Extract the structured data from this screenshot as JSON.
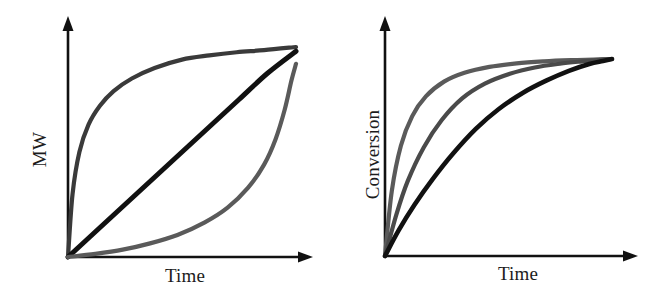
{
  "figure": {
    "background": "#ffffff",
    "width": 657,
    "height": 295
  },
  "panels": [
    {
      "id": "left",
      "x_label": "Time",
      "y_label": "MW"
    },
    {
      "id": "right",
      "x_label": "Time",
      "y_label": "Conversion"
    }
  ],
  "chart_data": [
    {
      "type": "line",
      "title": "",
      "xlabel": "Time",
      "ylabel": "MW",
      "xlim": [
        0,
        1
      ],
      "ylim": [
        0,
        1
      ],
      "grid": false,
      "legend": "none",
      "annotation": "Three idealized molecular-weight build-up profiles sharing a common origin and converging near full conversion: a convex (step-growth-like rapid rise), a linear, and a concave (chain-growth-like delayed rise) trace.",
      "series": [
        {
          "name": "convex-rapid-rise",
          "color": "#3a3a3a",
          "linewidth": 4.2,
          "x": [
            0,
            0.02,
            0.05,
            0.09,
            0.14,
            0.2,
            0.28,
            0.38,
            0.5,
            0.62,
            0.74,
            0.86,
            1.0
          ],
          "y": [
            0,
            0.3,
            0.5,
            0.63,
            0.72,
            0.79,
            0.85,
            0.9,
            0.94,
            0.96,
            0.975,
            0.985,
            1.0
          ]
        },
        {
          "name": "linear",
          "color": "#111111",
          "linewidth": 5.0,
          "x": [
            0,
            0.125,
            0.25,
            0.375,
            0.5,
            0.625,
            0.75,
            0.875,
            1.0
          ],
          "y": [
            0,
            0.125,
            0.25,
            0.375,
            0.5,
            0.625,
            0.75,
            0.875,
            0.98
          ]
        },
        {
          "name": "concave-delayed-rise",
          "color": "#5a5a5a",
          "linewidth": 4.2,
          "x": [
            0,
            0.12,
            0.24,
            0.36,
            0.48,
            0.6,
            0.7,
            0.79,
            0.86,
            0.91,
            0.95,
            0.98,
            1.0
          ],
          "y": [
            0,
            0.015,
            0.035,
            0.065,
            0.105,
            0.165,
            0.235,
            0.33,
            0.44,
            0.56,
            0.7,
            0.84,
            0.92
          ]
        }
      ]
    },
    {
      "type": "line",
      "title": "",
      "xlabel": "Time",
      "ylabel": "Conversion",
      "xlim": [
        0,
        1
      ],
      "ylim": [
        0,
        1
      ],
      "grid": false,
      "legend": "none",
      "annotation": "Three saturating conversion-versus-time curves with decreasing rate constants, all starting at the origin and approaching the same plateau.",
      "series": [
        {
          "name": "fastest-rate",
          "color": "#5a5a5a",
          "linewidth": 4.2,
          "x": [
            0,
            0.03,
            0.07,
            0.12,
            0.18,
            0.26,
            0.35,
            0.46,
            0.58,
            0.7,
            0.82,
            0.92,
            1.0
          ],
          "y": [
            0,
            0.33,
            0.56,
            0.71,
            0.81,
            0.885,
            0.93,
            0.96,
            0.978,
            0.988,
            0.994,
            0.997,
            1.0
          ]
        },
        {
          "name": "medium-rate",
          "color": "#4a4a4a",
          "linewidth": 4.2,
          "x": [
            0,
            0.05,
            0.1,
            0.17,
            0.25,
            0.34,
            0.44,
            0.55,
            0.66,
            0.77,
            0.87,
            0.94,
            1.0
          ],
          "y": [
            0,
            0.21,
            0.38,
            0.55,
            0.69,
            0.8,
            0.875,
            0.925,
            0.957,
            0.976,
            0.988,
            0.995,
            1.0
          ]
        },
        {
          "name": "slowest-rate",
          "color": "#111111",
          "linewidth": 4.6,
          "x": [
            0,
            0.06,
            0.13,
            0.21,
            0.3,
            0.4,
            0.5,
            0.61,
            0.71,
            0.81,
            0.9,
            0.96,
            1.0
          ],
          "y": [
            0,
            0.13,
            0.26,
            0.39,
            0.52,
            0.645,
            0.745,
            0.83,
            0.89,
            0.94,
            0.975,
            0.99,
            1.0
          ]
        }
      ]
    }
  ]
}
